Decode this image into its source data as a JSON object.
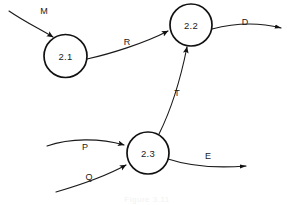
{
  "diagram": {
    "type": "data-flow-diagram",
    "canvas": {
      "width": 294,
      "height": 205,
      "background": "#ffffff"
    },
    "stroke_color": "#111111",
    "text_color": "#1a1a1a",
    "processes": [
      {
        "id": "p21",
        "label": "2.1",
        "cx": 65.5,
        "cy": 56,
        "r": 21.5
      },
      {
        "id": "p22",
        "label": "2.2",
        "cx": 191,
        "cy": 25,
        "r": 21
      },
      {
        "id": "p23",
        "label": "2.3",
        "cx": 148,
        "cy": 153,
        "r": 21
      }
    ],
    "flows": [
      {
        "id": "f-m",
        "label": "M",
        "label_x": 44,
        "label_y": 12,
        "from": "external-left",
        "to": "2.1"
      },
      {
        "id": "f-r",
        "label": "R",
        "label_x": 127,
        "label_y": 43,
        "from": "2.1",
        "to": "2.2"
      },
      {
        "id": "f-d",
        "label": "D",
        "label_x": 245,
        "label_y": 23,
        "from": "2.2",
        "to": "external-right"
      },
      {
        "id": "f-t",
        "label": "T",
        "label_x": 177,
        "label_y": 94,
        "from": "2.3",
        "to": "2.2"
      },
      {
        "id": "f-p",
        "label": "P",
        "label_x": 85,
        "label_y": 148,
        "from": "external-left",
        "to": "2.3"
      },
      {
        "id": "f-q",
        "label": "Q",
        "label_x": 89,
        "label_y": 178,
        "from": "external-left",
        "to": "2.3"
      },
      {
        "id": "f-e",
        "label": "E",
        "label_x": 208,
        "label_y": 157,
        "from": "2.3",
        "to": "external-right"
      }
    ],
    "caption": "Figure 3.11"
  }
}
